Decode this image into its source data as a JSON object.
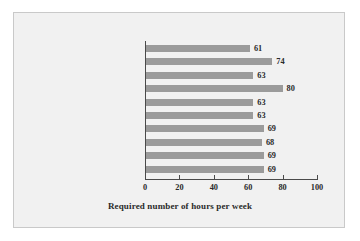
{
  "chart_data": {
    "type": "bar",
    "orientation": "horizontal",
    "title": "",
    "xlabel": "Required number of hours per week",
    "ylabel": "",
    "categories": [
      "British Columbia",
      "Alberta",
      "Saskatchewan",
      "Manitoba",
      "Ontario",
      "Quebec",
      "New Brunswick",
      "Nova Scotia",
      "Prince Edward Island",
      "Newfoundland"
    ],
    "values": [
      61,
      74,
      63,
      80,
      63,
      63,
      69,
      68,
      69,
      69
    ],
    "value_labels": [
      "61",
      "74",
      "63",
      "80",
      "63",
      "63",
      "69",
      "68",
      "69",
      "69"
    ],
    "xlim": [
      0,
      100
    ],
    "xticks": [
      0,
      20,
      40,
      60,
      80,
      100
    ],
    "xtick_labels": [
      "0",
      "20",
      "40",
      "60",
      "80",
      "100"
    ],
    "grid": false,
    "legend": false,
    "bar_color": "#9b9b9b",
    "axis_color": "#4a4a4a",
    "text_color": "#2a2a2a",
    "background_color": "#f1f1f1"
  }
}
